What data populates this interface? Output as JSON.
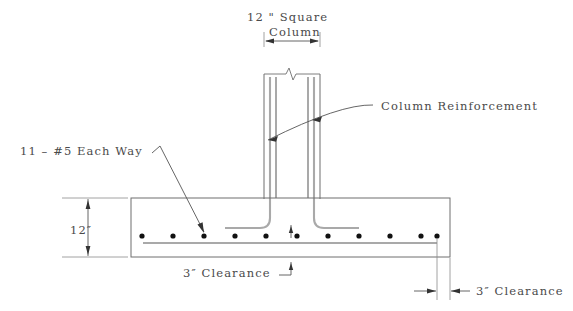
{
  "drawing": {
    "title_note": "",
    "labels": {
      "column_size": "12 \" Square",
      "column_word": "Column",
      "column_reinforcement": "Column Reinforcement",
      "footing_bars": "11 – #5 Each Way",
      "footing_depth": "12″",
      "bottom_clearance": "3″ Clearance",
      "side_clearance": "3″ Clearance"
    },
    "icons": {
      "break_symbol": "break-line-icon",
      "arrow_left": "arrow-left-icon",
      "arrow_right": "arrow-right-icon",
      "arrow_up": "arrow-up-icon",
      "arrow_down": "arrow-down-icon"
    },
    "colors": {
      "outline": "#6f6f6f",
      "rebar": "#a9a9a9",
      "dimension": "#555555",
      "text": "#4a4a4a",
      "dot": "#111111",
      "background": "#ffffff"
    },
    "geometry": {
      "footing": {
        "left": 131,
        "right": 450,
        "top": 198,
        "bottom": 257
      },
      "column": {
        "left": 264,
        "right": 320,
        "top": 72,
        "bottom": 198
      },
      "bar_count": 11,
      "bar_y": 236,
      "bar_x_positions": [
        142,
        173,
        204,
        235,
        266,
        297,
        328,
        359,
        390,
        421,
        437
      ],
      "mat_line": {
        "x1": 143,
        "x2": 437,
        "y": 243
      },
      "depth_dimension_x": 88,
      "top_dimension_y": 41
    }
  }
}
